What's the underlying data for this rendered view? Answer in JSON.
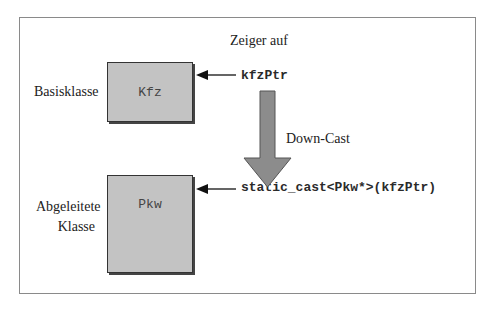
{
  "diagram": {
    "header_label": "Zeiger auf",
    "base": {
      "side_label": "Basisklasse",
      "class_name": "Kfz",
      "pointer": "kfzPtr"
    },
    "cast_label": "Down-Cast",
    "derived": {
      "side_label_line1": "Abgeleitete",
      "side_label_line2": "Klasse",
      "class_name": "Pkw",
      "pointer": "static_cast<Pkw*>(kfzPtr)"
    },
    "colors": {
      "box_fill": "#c3c3c3",
      "box_border": "#333333",
      "big_arrow_fill": "#8c8c8c",
      "frame_border": "#8a8a8a"
    }
  }
}
